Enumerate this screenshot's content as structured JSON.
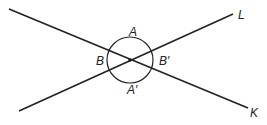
{
  "diagram": {
    "type": "intersecting-lines-angles",
    "colors": {
      "line": "#222222",
      "background": "#ffffff"
    },
    "lines": [
      {
        "name": "K",
        "x1": 9,
        "y1": 9,
        "x2": 248,
        "y2": 108
      },
      {
        "name": "L",
        "x1": 19,
        "y1": 111,
        "x2": 233,
        "y2": 14
      }
    ],
    "intersection": {
      "x": 130,
      "y": 60
    },
    "circle_radius": 23,
    "labels": {
      "line_L": "L",
      "line_K": "K",
      "angle_top": "A",
      "angle_bottom": "A′",
      "angle_left": "B",
      "angle_right": "B′"
    }
  }
}
